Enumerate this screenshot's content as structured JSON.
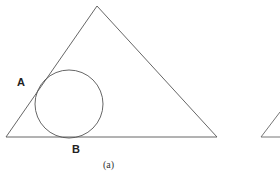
{
  "figure": {
    "caption": "(a)",
    "labels": {
      "A": "A",
      "B": "B"
    },
    "colors": {
      "stroke": "#555555",
      "background": "#ffffff"
    },
    "triangle": {
      "apex": [
        97,
        6
      ],
      "left": [
        6,
        137
      ],
      "right": [
        217,
        137
      ]
    },
    "circle": {
      "cx": 69,
      "cy": 104,
      "r": 34
    },
    "partial_triangle": {
      "left": [
        261,
        137
      ],
      "upper": [
        280,
        112
      ]
    }
  }
}
